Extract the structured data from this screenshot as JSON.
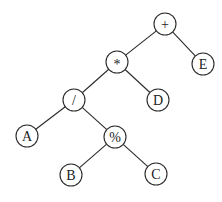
{
  "diagram": {
    "type": "expression-tree",
    "radius": 11,
    "nodes": [
      {
        "id": "plus",
        "label": "+",
        "x": 165,
        "y": 24
      },
      {
        "id": "mul",
        "label": "*",
        "x": 117,
        "y": 62
      },
      {
        "id": "E",
        "label": "E",
        "x": 203,
        "y": 64
      },
      {
        "id": "div",
        "label": "/",
        "x": 74,
        "y": 100
      },
      {
        "id": "D",
        "label": "D",
        "x": 158,
        "y": 100
      },
      {
        "id": "A",
        "label": "A",
        "x": 27,
        "y": 136
      },
      {
        "id": "mod",
        "label": "%",
        "x": 115,
        "y": 137
      },
      {
        "id": "B",
        "label": "B",
        "x": 71,
        "y": 175
      },
      {
        "id": "C",
        "label": "C",
        "x": 156,
        "y": 174
      }
    ],
    "edges": [
      [
        "plus",
        "mul"
      ],
      [
        "plus",
        "E"
      ],
      [
        "mul",
        "div"
      ],
      [
        "mul",
        "D"
      ],
      [
        "div",
        "A"
      ],
      [
        "div",
        "mod"
      ],
      [
        "mod",
        "B"
      ],
      [
        "mod",
        "C"
      ]
    ]
  }
}
